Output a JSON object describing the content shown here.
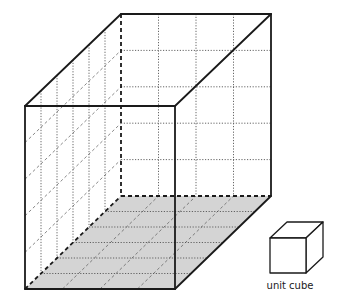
{
  "diagram": {
    "box_dimensions_units": {
      "width": 4,
      "height": 5,
      "depth": 6
    },
    "floor_shaded": true,
    "unit_cube_label": "unit cube",
    "colors": {
      "edge": "#1a1a1a",
      "grid": "#555555",
      "floor_fill": "#d4d4d4"
    }
  }
}
